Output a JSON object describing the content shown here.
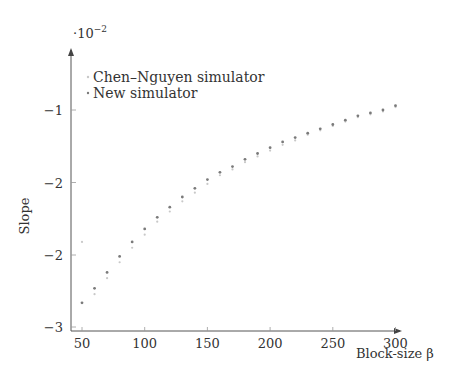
{
  "chart_data": {
    "type": "scatter",
    "title": "",
    "xlabel": "Block-size β",
    "ylabel": "Slope",
    "y_multiplier": "·10⁻²",
    "xlim": [
      50,
      300
    ],
    "ylim": [
      -3,
      -0.9
    ],
    "x_ticks": [
      50,
      100,
      150,
      200,
      250,
      300
    ],
    "y_ticks": [
      {
        "value": -1.0,
        "label": "−1"
      },
      {
        "value": -1.5,
        "label": "−2"
      },
      {
        "value": -2.0,
        "label": "−2"
      },
      {
        "value": -2.5,
        "label": "−3"
      }
    ],
    "grid": false,
    "legend_position": "upper left",
    "series": [
      {
        "name": "Chen–Nguyen simulator",
        "color": "#c8c8c8",
        "x": [
          50,
          60,
          70,
          80,
          90,
          100,
          110,
          120,
          130,
          140,
          150,
          160,
          170,
          180,
          190,
          200,
          210,
          220,
          230,
          240,
          250,
          260,
          270,
          280,
          290,
          300
        ],
        "values": [
          -1.91,
          -2.27,
          -2.16,
          -2.05,
          -1.95,
          -1.86,
          -1.77,
          -1.7,
          -1.63,
          -1.57,
          -1.51,
          -1.45,
          -1.41,
          -1.36,
          -1.32,
          -1.28,
          -1.24,
          -1.21,
          -1.17,
          -1.14,
          -1.11,
          -1.08,
          -1.05,
          -1.03,
          -1.01,
          -0.98
        ]
      },
      {
        "name": "New simulator",
        "color": "#7a7a7a",
        "x": [
          50,
          60,
          70,
          80,
          90,
          100,
          110,
          120,
          130,
          140,
          150,
          160,
          170,
          180,
          190,
          200,
          210,
          220,
          230,
          240,
          250,
          260,
          270,
          280,
          290,
          300
        ],
        "values": [
          -2.33,
          -2.23,
          -2.12,
          -2.01,
          -1.91,
          -1.82,
          -1.74,
          -1.67,
          -1.6,
          -1.54,
          -1.48,
          -1.43,
          -1.39,
          -1.34,
          -1.3,
          -1.26,
          -1.22,
          -1.19,
          -1.16,
          -1.13,
          -1.1,
          -1.07,
          -1.04,
          -1.02,
          -1.0,
          -0.97
        ]
      }
    ]
  }
}
